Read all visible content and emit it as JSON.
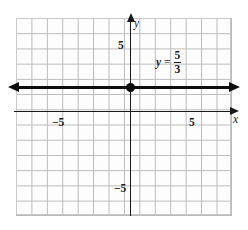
{
  "figure": {
    "name": "coordinate-plane-graph",
    "background_color": "#ffffff"
  },
  "grid": {
    "line_color": "#b9b9b9",
    "columns": 14,
    "rows": 13,
    "cell_size_units": 1
  },
  "axes": {
    "x": {
      "label": "x",
      "arrow": "right",
      "color": "#1a1a1a",
      "ticks": [
        {
          "value": -5,
          "label": "−5"
        },
        {
          "value": 5,
          "label": "5"
        }
      ]
    },
    "y": {
      "label": "y",
      "arrow": "up",
      "color": "#1a1a1a",
      "ticks": [
        {
          "value": 5,
          "label": "5"
        },
        {
          "value": -5,
          "label": "−5"
        }
      ]
    }
  },
  "annotation": {
    "equation_lhs": "y",
    "equation_equals": "=",
    "fraction_numerator": "5",
    "fraction_denominator": "3"
  },
  "chart_data": {
    "type": "line",
    "title": "",
    "xlabel": "x",
    "ylabel": "y",
    "xlim": [
      -8,
      6
    ],
    "ylim": [
      -8,
      5
    ],
    "grid": true,
    "legend": "none",
    "series": [
      {
        "name": "y = 5/3",
        "equation": "y = 5/3",
        "kind": "horizontal-line",
        "constant_y": 1.6667,
        "slope": 0,
        "intercept": 1.6667,
        "arrows_both_ends": true,
        "color": "#0d0d0d",
        "x": [
          -8,
          6
        ],
        "values": [
          1.6667,
          1.6667
        ]
      }
    ],
    "points": [
      {
        "name": "y-intercept",
        "x": 0,
        "y": 1.6667,
        "style": "filled-circle",
        "color": "#0d0d0d"
      }
    ],
    "annotations": [
      {
        "text": "y = 5/3",
        "x": 2.5,
        "y": 3.5
      }
    ]
  }
}
